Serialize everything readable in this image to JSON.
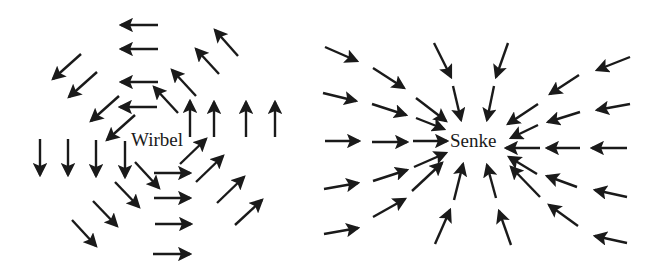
{
  "figure": {
    "panels": [
      {
        "name": "wirbel",
        "label": "Wirbel",
        "description": "Vortex: arrows circulating counter-clockwise around the center",
        "arrows": [
          [
            158,
            25,
            121,
            25
          ],
          [
            158,
            49,
            121,
            49
          ],
          [
            158,
            82,
            121,
            82
          ],
          [
            157,
            107,
            120,
            107
          ],
          [
            81,
            54,
            53,
            79
          ],
          [
            97,
            72,
            69,
            97
          ],
          [
            119,
            96,
            91,
            121
          ],
          [
            135,
            115,
            107,
            140
          ],
          [
            238,
            56,
            215,
            30
          ],
          [
            219,
            74,
            196,
            49
          ],
          [
            196,
            96,
            172,
            70
          ],
          [
            178,
            113,
            154,
            87
          ],
          [
            190,
            137,
            190,
            101
          ],
          [
            214,
            137,
            214,
            102
          ],
          [
            246,
            137,
            246,
            102
          ],
          [
            275,
            137,
            275,
            102
          ],
          [
            40,
            139,
            40,
            175
          ],
          [
            68,
            139,
            68,
            175
          ],
          [
            96,
            140,
            96,
            176
          ],
          [
            125,
            141,
            125,
            177
          ],
          [
            135,
            162,
            159,
            188
          ],
          [
            115,
            182,
            139,
            207
          ],
          [
            93,
            201,
            117,
            226
          ],
          [
            72,
            220,
            96,
            246
          ],
          [
            154,
            173,
            190,
            173
          ],
          [
            154,
            198,
            190,
            198
          ],
          [
            155,
            224,
            191,
            224
          ],
          [
            153,
            254,
            190,
            254
          ],
          [
            180,
            164,
            206,
            139
          ],
          [
            196,
            182,
            223,
            156
          ],
          [
            217,
            203,
            244,
            177
          ],
          [
            235,
            225,
            262,
            200
          ]
        ]
      },
      {
        "name": "senke",
        "label": "Senke",
        "description": "Sink: arrows pointing radially inward toward the center",
        "arrows": [
          [
            325,
            47,
            357,
            61
          ],
          [
            323,
            93,
            356,
            101
          ],
          [
            325,
            141,
            359,
            141
          ],
          [
            324,
            189,
            358,
            183
          ],
          [
            324,
            234,
            358,
            228
          ],
          [
            373,
            68,
            404,
            88
          ],
          [
            372,
            104,
            406,
            115
          ],
          [
            372,
            142,
            407,
            142
          ],
          [
            373,
            181,
            407,
            170
          ],
          [
            373,
            217,
            405,
            199
          ],
          [
            416,
            98,
            446,
            121
          ],
          [
            416,
            118,
            444,
            129
          ],
          [
            413,
            141,
            447,
            141
          ],
          [
            414,
            167,
            446,
            153
          ],
          [
            412,
            191,
            442,
            163
          ],
          [
            434,
            43,
            451,
            77
          ],
          [
            453,
            86,
            461,
            120
          ],
          [
            508,
            43,
            496,
            77
          ],
          [
            494,
            86,
            487,
            120
          ],
          [
            454,
            200,
            463,
            164
          ],
          [
            435,
            244,
            450,
            210
          ],
          [
            496,
            198,
            487,
            165
          ],
          [
            511,
            245,
            499,
            211
          ],
          [
            540,
            148,
            506,
            148
          ],
          [
            580,
            148,
            547,
            148
          ],
          [
            627,
            148,
            592,
            148
          ],
          [
            538,
            104,
            508,
            124
          ],
          [
            538,
            125,
            511,
            138
          ],
          [
            580,
            112,
            548,
            122
          ],
          [
            579,
            75,
            550,
            94
          ],
          [
            630,
            57,
            597,
            70
          ],
          [
            630,
            104,
            597,
            110
          ],
          [
            537,
            174,
            509,
            157
          ],
          [
            540,
            197,
            511,
            167
          ],
          [
            577,
            187,
            547,
            176
          ],
          [
            578,
            226,
            549,
            205
          ],
          [
            627,
            197,
            595,
            190
          ],
          [
            627,
            243,
            595,
            236
          ]
        ]
      }
    ],
    "style": {
      "arrow_color": "#1a1a1a",
      "stroke_width": 2.4,
      "background": "#ffffff"
    }
  }
}
